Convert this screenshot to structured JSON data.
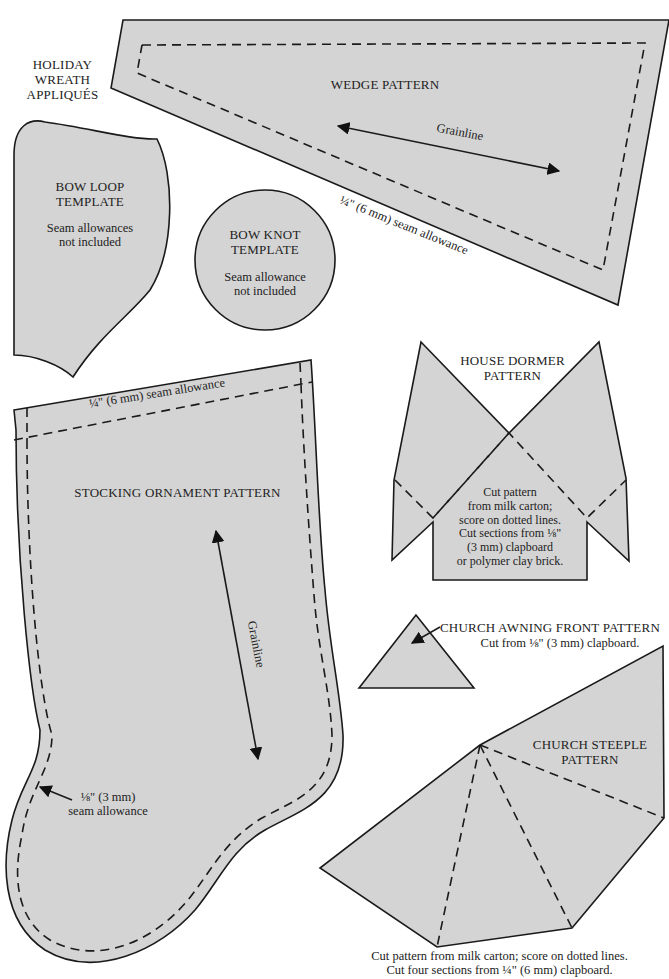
{
  "page": {
    "section_title": "HOLIDAY\nWREATH\nAPPLIQUÉS",
    "background": "#ffffff",
    "fill_color": "#d4d4d4",
    "stroke_color": "#1a1a1a"
  },
  "patterns": {
    "wedge": {
      "title": "WEDGE PATTERN",
      "grainline": "Grainline",
      "seam_note": "¼\" (6 mm) seam allowance"
    },
    "bow_loop": {
      "title": "BOW LOOP\nTEMPLATE",
      "note": "Seam allowances\nnot included"
    },
    "bow_knot": {
      "title": "BOW KNOT\nTEMPLATE",
      "note": "Seam allowance\nnot included"
    },
    "house_dormer": {
      "title": "HOUSE DORMER\nPATTERN",
      "note": "Cut pattern\nfrom milk carton;\nscore on dotted lines.\nCut sections from ⅛\"\n(3 mm) clapboard\nor polymer clay brick."
    },
    "stocking": {
      "title": "STOCKING ORNAMENT PATTERN",
      "top_seam_note": "¼\" (6 mm) seam allowance",
      "grainline": "Grainline",
      "side_seam_note": "⅛\" (3 mm)\nseam allowance"
    },
    "church_awning": {
      "title": "CHURCH AWNING FRONT PATTERN",
      "note": "Cut from ⅛\" (3 mm) clapboard."
    },
    "church_steeple": {
      "title": "CHURCH STEEPLE\nPATTERN",
      "note": "Cut pattern from milk carton; score on dotted lines.\nCut four sections from ¼\" (6 mm) clapboard."
    }
  }
}
